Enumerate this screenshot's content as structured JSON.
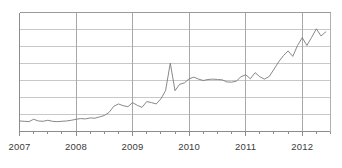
{
  "chart_data": {
    "type": "line",
    "title": "",
    "subtitle": "",
    "xlabel": "",
    "ylabel": "",
    "grid": true,
    "legend": null,
    "legend_position": "none",
    "line_color": "#7a7a7a",
    "grid_color": "#c8c8c8",
    "axis_color": "#8c8c8c",
    "background_color": "#ffffff",
    "xlim": [
      2007.0,
      2012.5
    ],
    "ylim": [
      0,
      7
    ],
    "y_gridline_values": [
      0,
      1,
      2,
      3,
      4,
      5,
      6,
      7
    ],
    "y_tick_labels": [],
    "x_tick_labels": [
      "2007",
      "2008",
      "2009",
      "2010",
      "2011",
      "2012"
    ],
    "x_tick_values": [
      2007,
      2008,
      2009,
      2010,
      2011,
      2012
    ],
    "x_minor_ticks_per_year": 4,
    "series": [
      {
        "name": "series-1",
        "x": [
          2007.0,
          2007.083,
          2007.167,
          2007.25,
          2007.333,
          2007.417,
          2007.5,
          2007.583,
          2007.667,
          2007.75,
          2007.833,
          2007.917,
          2008.0,
          2008.083,
          2008.167,
          2008.25,
          2008.333,
          2008.417,
          2008.5,
          2008.583,
          2008.667,
          2008.75,
          2008.833,
          2008.917,
          2009.0,
          2009.083,
          2009.167,
          2009.25,
          2009.333,
          2009.417,
          2009.5,
          2009.583,
          2009.667,
          2009.75,
          2009.833,
          2009.917,
          2010.0,
          2010.083,
          2010.167,
          2010.25,
          2010.333,
          2010.417,
          2010.5,
          2010.583,
          2010.667,
          2010.75,
          2010.833,
          2010.917,
          2011.0,
          2011.083,
          2011.167,
          2011.25,
          2011.333,
          2011.417,
          2011.5,
          2011.583,
          2011.667,
          2011.75,
          2011.833,
          2011.917,
          2012.0,
          2012.083,
          2012.167,
          2012.25,
          2012.333,
          2012.417
        ],
        "values": [
          0.62,
          0.6,
          0.58,
          0.72,
          0.62,
          0.6,
          0.66,
          0.6,
          0.58,
          0.6,
          0.62,
          0.66,
          0.72,
          0.76,
          0.74,
          0.8,
          0.78,
          0.86,
          0.94,
          1.12,
          1.48,
          1.62,
          1.52,
          1.46,
          1.7,
          1.54,
          1.42,
          1.76,
          1.7,
          1.62,
          1.92,
          2.4,
          4.02,
          2.4,
          2.78,
          2.86,
          3.1,
          3.2,
          3.08,
          3.0,
          3.06,
          3.08,
          3.06,
          3.04,
          2.92,
          2.9,
          2.96,
          3.22,
          3.34,
          3.1,
          3.46,
          3.22,
          3.08,
          3.24,
          3.66,
          4.1,
          4.46,
          4.74,
          4.42,
          5.06,
          5.52,
          5.06,
          5.54,
          6.04,
          5.62,
          5.86
        ]
      }
    ]
  },
  "axis": {
    "x_labels": [
      {
        "text": "2007",
        "value": 2007
      },
      {
        "text": "2008",
        "value": 2008
      },
      {
        "text": "2009",
        "value": 2009
      },
      {
        "text": "2010",
        "value": 2010
      },
      {
        "text": "2011",
        "value": 2011
      },
      {
        "text": "2012",
        "value": 2012
      }
    ]
  }
}
